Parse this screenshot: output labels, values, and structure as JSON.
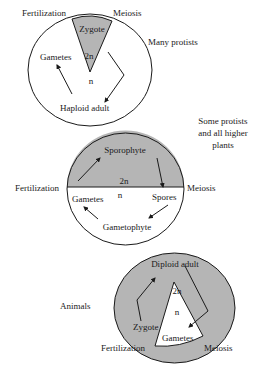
{
  "colors": {
    "fill_diploid": "#b5b5b5",
    "fill_haploid": "#ffffff",
    "stroke": "#1a1a1a"
  },
  "cycles": [
    {
      "id": "haploid-dominant",
      "group_label": "Many protists",
      "stages": {
        "fertilization": "Fertilization",
        "meiosis": "Meiosis",
        "zygote": "Zygote",
        "gametes": "Gametes",
        "adult": "Haploid adult"
      },
      "ploidy": {
        "diploid": "2n",
        "haploid": "n"
      }
    },
    {
      "id": "alternation-of-generations",
      "group_label_lines": [
        "Some protists",
        "and all higher",
        "plants"
      ],
      "stages": {
        "fertilization": "Fertilization",
        "meiosis": "Meiosis",
        "sporophyte": "Sporophyte",
        "gametes": "Gametes",
        "spores": "Spores",
        "gametophyte": "Gametophyte"
      },
      "ploidy": {
        "diploid": "2n",
        "haploid": "n"
      }
    },
    {
      "id": "diploid-dominant",
      "group_label": "Animals",
      "stages": {
        "fertilization": "Fertilization",
        "meiosis": "Meiosis",
        "adult": "Diploid adult",
        "zygote": "Zygote",
        "gametes": "Gametes"
      },
      "ploidy": {
        "diploid": "2n",
        "haploid": "n"
      }
    }
  ]
}
